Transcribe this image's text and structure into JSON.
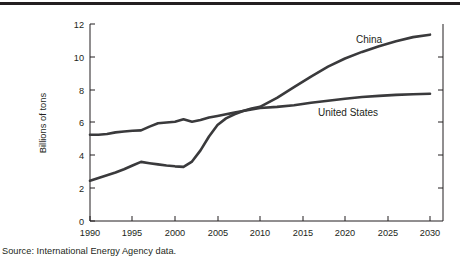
{
  "figure": {
    "source_note": "Source: International Energy Agency data."
  },
  "labels": {
    "china": "China",
    "united_states": "United States",
    "y_axis_title": "Billions of tons"
  },
  "chart_data": {
    "type": "line",
    "title": "",
    "xlabel": "",
    "ylabel": "Billions of tons",
    "xlim": [
      1990,
      2030
    ],
    "ylim": [
      0,
      12
    ],
    "xticks": [
      1990,
      1995,
      2000,
      2005,
      2010,
      2015,
      2020,
      2025,
      2030
    ],
    "yticks": [
      0,
      2,
      4,
      6,
      8,
      10,
      12
    ],
    "grid": false,
    "legend": "inline-annotations",
    "x": [
      1990,
      1991,
      1992,
      1993,
      1994,
      1995,
      1996,
      1997,
      1998,
      1999,
      2000,
      2001,
      2002,
      2003,
      2004,
      2005,
      2006,
      2007,
      2008,
      2009,
      2010,
      2012,
      2014,
      2016,
      2018,
      2020,
      2022,
      2024,
      2026,
      2028,
      2030
    ],
    "series": [
      {
        "name": "China",
        "values": [
          2.45,
          2.62,
          2.78,
          2.95,
          3.15,
          3.38,
          3.6,
          3.52,
          3.45,
          3.38,
          3.33,
          3.3,
          3.62,
          4.3,
          5.15,
          5.85,
          6.25,
          6.5,
          6.7,
          6.85,
          6.95,
          7.5,
          8.15,
          8.8,
          9.4,
          9.9,
          10.3,
          10.65,
          10.95,
          11.2,
          11.35
        ]
      },
      {
        "name": "United States",
        "values": [
          5.25,
          5.25,
          5.3,
          5.4,
          5.45,
          5.5,
          5.52,
          5.75,
          5.95,
          6.0,
          6.05,
          6.2,
          6.05,
          6.15,
          6.3,
          6.4,
          6.5,
          6.6,
          6.7,
          6.8,
          6.88,
          6.95,
          7.05,
          7.2,
          7.32,
          7.45,
          7.55,
          7.62,
          7.68,
          7.72,
          7.75
        ]
      }
    ],
    "annotations": [
      {
        "text": "China",
        "x": 2014,
        "y": 11.0
      },
      {
        "text": "United States",
        "x": 2011,
        "y": 6.0
      }
    ]
  }
}
